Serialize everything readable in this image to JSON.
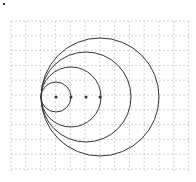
{
  "diagram": {
    "type": "nested tangent circles on grid",
    "grid": {
      "x0": 11,
      "y0": 21,
      "x1": 189,
      "y1": 172,
      "spacing": 14.8,
      "color": "#c8c8c8",
      "dash": "2,2"
    },
    "tangent_point": {
      "x": 41,
      "y": 97
    },
    "circles": [
      {
        "cx": 56,
        "cy": 97,
        "r": 15
      },
      {
        "cx": 71,
        "cy": 97,
        "r": 30
      },
      {
        "cx": 86,
        "cy": 97,
        "r": 45
      },
      {
        "cx": 100,
        "cy": 97,
        "r": 59
      }
    ],
    "center_dot_color": "#333333",
    "stroke_color": "#333333",
    "corner_mark": {
      "x": 3,
      "y": 3
    }
  }
}
